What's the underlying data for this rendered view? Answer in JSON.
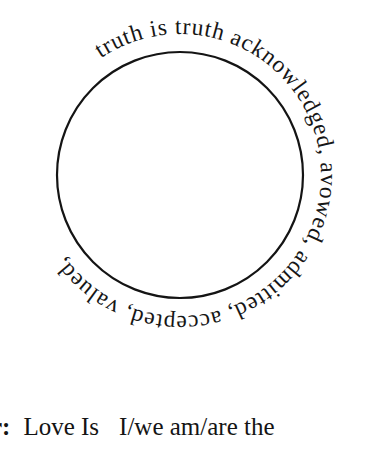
{
  "page": {
    "background_color": "#ffffff",
    "ink_color": "#161616"
  },
  "emblem": {
    "type": "circular-text-seal",
    "circle": {
      "center_x": 180,
      "center_y": 175,
      "radius": 123,
      "stroke_width": 2.2,
      "stroke_color": "#141414",
      "fill": "none"
    },
    "ring_text": "truth is truth acknowledged, avowed, admitted, accepted, valued,",
    "ring_text_words": [
      "truth",
      "is",
      "truth",
      "acknowledged,",
      "avowed,",
      "admitted,",
      "accepted,",
      "valued,"
    ],
    "ring_text_direction": "clockwise",
    "ring_text_start_position": "top-left",
    "ring_text_radius": 141,
    "ring_font_size": "23.5px"
  },
  "caption": {
    "clipped_left_fragment": "r:",
    "clipped_left_is_bold": true,
    "segment_one": "Love Is",
    "segment_two": "I/we am/are the",
    "full_visible_text": "r: Love Is  I/we am/are the",
    "clipped_right": true
  }
}
